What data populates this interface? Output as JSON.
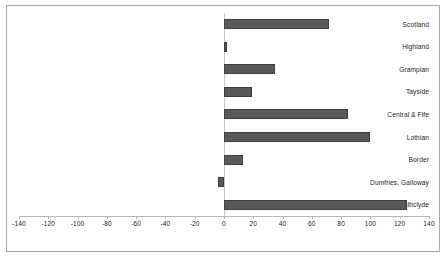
{
  "chart_data": {
    "type": "bar",
    "orientation": "horizontal",
    "title": "",
    "xlabel": "",
    "ylabel": "",
    "categories": [
      "Scotland",
      "Highland",
      "Grampian",
      "Tayside",
      "Central & Fife",
      "Lothian",
      "Border",
      "Dumfries, Galloway",
      "Strathclyde"
    ],
    "values": [
      72,
      2,
      35,
      19,
      85,
      100,
      13,
      -4,
      125
    ],
    "xlim": [
      -140,
      140
    ],
    "xticks": [
      -140,
      -120,
      -100,
      -80,
      -60,
      -40,
      -20,
      0,
      20,
      40,
      60,
      80,
      100,
      120,
      140
    ],
    "xtick_labels": [
      "-140",
      "-120",
      "-100",
      "-80",
      "-60",
      "-40",
      "-20",
      "0",
      "20",
      "40",
      "60",
      "80",
      "100",
      "120",
      "140"
    ],
    "grid": false,
    "legend": null,
    "bar_color": "#595959",
    "bar_border_color": "#3d3d3d",
    "axis_color": "#b5b5b5",
    "zero_line_color": "#c9c9c9",
    "frame_color": "#a8a8a8",
    "background": "#ffffff"
  }
}
